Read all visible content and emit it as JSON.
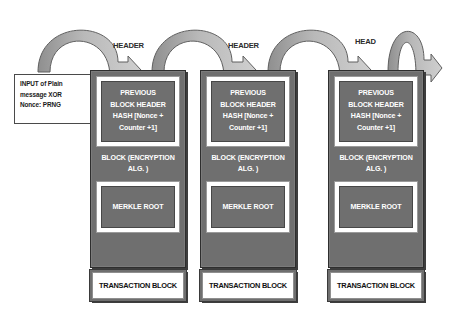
{
  "diagram": {
    "background": "#ffffff",
    "colors": {
      "block_fill": "#6f6f6f",
      "block_border": "#2e2e2e",
      "matte_fill": "#ffffff",
      "arc_fill": "#b8b8b8",
      "arc_stroke": "#5a5a5a",
      "text_on_dark": "#ffffff",
      "text_on_light": "#111111"
    }
  },
  "input_note": {
    "name": "input-note",
    "lines": [
      "INPUT of Plain",
      "message XOR",
      "Nonce: PRNG"
    ]
  },
  "header_labels": [
    {
      "text": "HEADER",
      "x": 113,
      "y": 46
    },
    {
      "text": "HEADER",
      "x": 228,
      "y": 46
    },
    {
      "text": "HEAD",
      "x": 355,
      "y": 42
    }
  ],
  "arcs": [
    {
      "name": "chain-arc-1",
      "start_x": 38,
      "end_x": 128,
      "peak_y": 17,
      "base_y": 72
    },
    {
      "name": "chain-arc-2",
      "start_x": 152,
      "end_x": 243,
      "peak_y": 17,
      "base_y": 72
    },
    {
      "name": "chain-arc-3",
      "start_x": 268,
      "end_x": 358,
      "peak_y": 17,
      "base_y": 72
    },
    {
      "name": "chain-arc-4",
      "start_x": 388,
      "end_x": 428,
      "peak_y": 17,
      "base_y": 72
    }
  ],
  "blocks": [
    {
      "name": "block-1",
      "x": 90,
      "y": 70,
      "width": 96,
      "height": 200,
      "hash_label": [
        "PREVIOUS",
        "BLOCK HEADER",
        "HASH [Nonce +",
        "Counter +1]"
      ],
      "band_label": [
        "BLOCK (ENCRYPTION",
        "ALG. )"
      ],
      "merkle_label": "MERKLE ROOT",
      "tx_label": "TRANSACTION BLOCK",
      "tx": {
        "x": 90,
        "y": 271,
        "width": 96,
        "height": 30
      }
    },
    {
      "name": "block-2",
      "x": 200,
      "y": 70,
      "width": 96,
      "height": 200,
      "hash_label": [
        "PREVIOUS",
        "BLOCK HEADER",
        "HASH [Nonce +",
        "Counter +1]"
      ],
      "band_label": [
        "BLOCK (ENCRYPTION",
        "ALG. )"
      ],
      "merkle_label": "MERKLE ROOT",
      "tx_label": "TRANSACTION BLOCK",
      "tx": {
        "x": 200,
        "y": 271,
        "width": 96,
        "height": 30
      }
    },
    {
      "name": "block-3",
      "x": 328,
      "y": 70,
      "width": 96,
      "height": 200,
      "hash_label": [
        "PREVIOUS",
        "BLOCK HEADER",
        "HASH [Nonce +",
        "Counter +1]"
      ],
      "band_label": [
        "BLOCK (ENCRYPTION",
        "ALG. )"
      ],
      "merkle_label": "MERKLE ROOT",
      "tx_label": "TRANSACTION BLOCK",
      "tx": {
        "x": 328,
        "y": 271,
        "width": 96,
        "height": 30
      }
    }
  ]
}
